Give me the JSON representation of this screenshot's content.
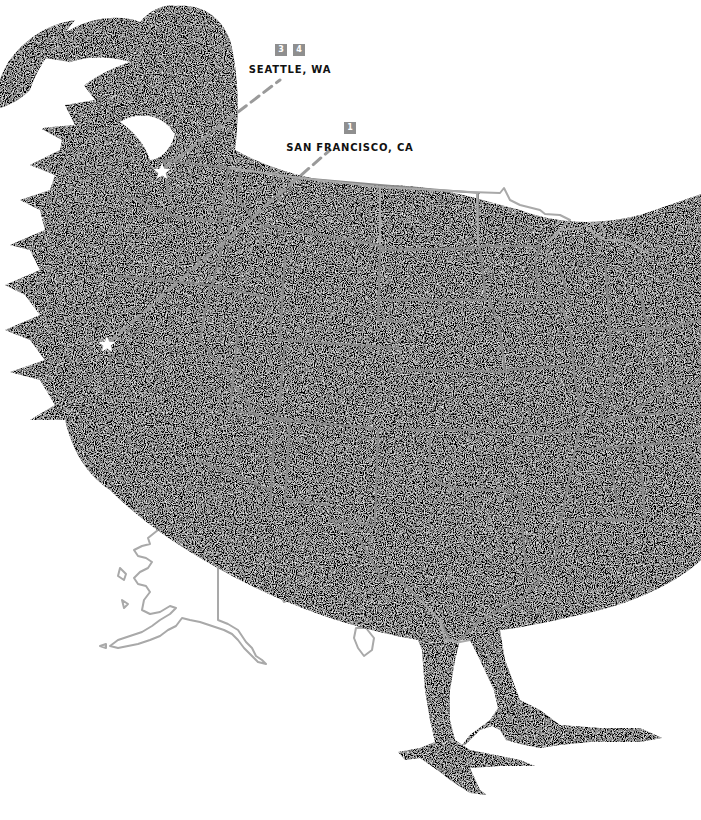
{
  "illustration": {
    "subject": "rooster silhouette filled with map of the United States",
    "silhouette_color": "#050505",
    "border_color": "#8a8a8a",
    "outline_color": "#a9a9a9",
    "background_color": "#ffffff",
    "star_color": "#ffffff",
    "dash_color": "#9a9a9a"
  },
  "locations": [
    {
      "city": "SEATTLE, WA",
      "badges": [
        "3",
        "4"
      ],
      "marker": "star-icon"
    },
    {
      "city": "SAN FRANCISCO, CA",
      "badges": [
        "1"
      ],
      "marker": "star-icon"
    }
  ]
}
